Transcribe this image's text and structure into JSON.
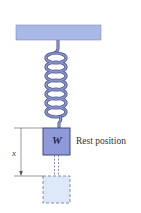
{
  "diagram": {
    "labels": {
      "weight": "W",
      "rest_position": "Rest position",
      "displacement": "x"
    },
    "colors": {
      "ceiling": "#a9b8e6",
      "spring": "#8a95c8",
      "spring_outline": "#4a5490",
      "block": "#8f9ad8",
      "block_outline": "#3e4780",
      "displaced_fill": "#dde9f8",
      "dashed_outline": "#6b7398",
      "dimension_line": "#555555"
    }
  }
}
